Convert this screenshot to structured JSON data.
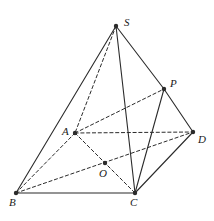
{
  "figure": {
    "type": "geometry-diagram",
    "stroke_color": "#2b2b2b",
    "background_color": "#ffffff",
    "points": [
      {
        "name": "S",
        "x": 116,
        "y": 26,
        "label": "S",
        "label_x": 124,
        "label_y": 17
      },
      {
        "name": "P",
        "x": 164,
        "y": 89,
        "label": "P",
        "label_x": 170,
        "label_y": 78
      },
      {
        "name": "D",
        "x": 193,
        "y": 132,
        "label": "D",
        "label_x": 198,
        "label_y": 134
      },
      {
        "name": "A",
        "x": 75,
        "y": 133,
        "label": "A",
        "label_x": 62,
        "label_y": 126
      },
      {
        "name": "O",
        "x": 105,
        "y": 163,
        "label": "O",
        "label_x": 99,
        "label_y": 168
      },
      {
        "name": "B",
        "x": 16,
        "y": 193,
        "label": "B",
        "label_x": 9,
        "label_y": 197
      },
      {
        "name": "C",
        "x": 135,
        "y": 193,
        "label": "C",
        "label_x": 130,
        "label_y": 197
      }
    ],
    "solid_edges": [
      {
        "name": "edge-S-B",
        "from": "S",
        "to": "B"
      },
      {
        "name": "edge-S-C",
        "from": "S",
        "to": "C"
      },
      {
        "name": "edge-S-P",
        "from": "S",
        "to": "P"
      },
      {
        "name": "edge-P-D",
        "from": "P",
        "to": "D"
      },
      {
        "name": "edge-P-C",
        "from": "P",
        "to": "C"
      },
      {
        "name": "edge-C-D",
        "from": "C",
        "to": "D"
      },
      {
        "name": "edge-B-C",
        "from": "B",
        "to": "C"
      }
    ],
    "dashed_edges": [
      {
        "name": "edge-S-A",
        "from": "S",
        "to": "A"
      },
      {
        "name": "edge-A-D",
        "from": "A",
        "to": "D"
      },
      {
        "name": "edge-A-P",
        "from": "A",
        "to": "P"
      },
      {
        "name": "edge-A-B",
        "from": "A",
        "to": "B"
      },
      {
        "name": "edge-A-C",
        "from": "A",
        "to": "C"
      },
      {
        "name": "edge-B-D",
        "from": "B",
        "to": "D"
      }
    ]
  }
}
